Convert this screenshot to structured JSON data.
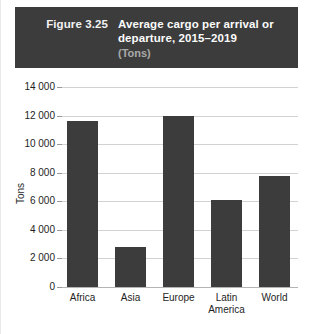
{
  "header": {
    "figure_number": "Figure 3.25",
    "title": "Average cargo per arrival or departure, 2015–2019",
    "subtitle": "(Tons)",
    "band_color": "#3c3c3c",
    "title_color": "#fbfbfb",
    "subtitle_color": "#a9a9a9"
  },
  "chart_data": {
    "type": "bar",
    "title": "Average cargo per arrival or departure, 2015–2019",
    "subtitle": "(Tons)",
    "figure_number": "Figure 3.25",
    "xlabel": "",
    "ylabel": "Tons",
    "ylim": [
      0,
      14000
    ],
    "ytick_step": 2000,
    "ytick_labels": [
      "14 000",
      "12 000",
      "10 000",
      "8 000",
      "6 000",
      "4 000",
      "2 000",
      "0"
    ],
    "ytick_values": [
      14000,
      12000,
      10000,
      8000,
      6000,
      4000,
      2000,
      0
    ],
    "grid": true,
    "legend": false,
    "bar_color": "#3c3c3c",
    "categories": [
      "Africa",
      "Asia",
      "Europe",
      "Latin America",
      "World"
    ],
    "values": [
      11600,
      2800,
      11950,
      6100,
      7800
    ]
  },
  "axis": {
    "y_label": "Tons"
  }
}
